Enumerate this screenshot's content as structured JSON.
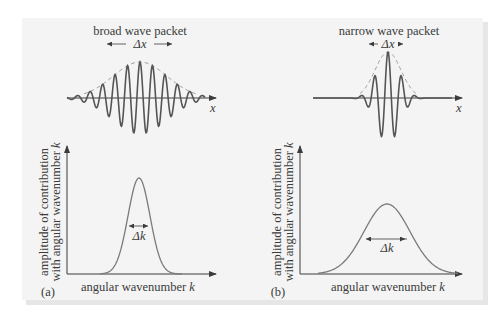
{
  "figure": {
    "panel_color": "#f4f4f4",
    "wave_color": "#555555",
    "envelope_color": "#9a9a9a",
    "axis_color": "#3c3c3c",
    "curve_color": "#7a7a7a"
  },
  "panel_a": {
    "tag": "(a)",
    "packet_title": "broad wave packet",
    "delta_x_label": "Δx",
    "x_axis_symbol": "x",
    "delta_k_label": "Δk",
    "xlabel_text": "angular wavenumber ",
    "xlabel_var": "k",
    "ylabel_line1": "amplitude of contribution",
    "ylabel_line2_text": "with angular wavenumber ",
    "ylabel_line2_var": "k"
  },
  "panel_b": {
    "tag": "(b)",
    "packet_title": "narrow wave packet",
    "delta_x_label": "Δx",
    "x_axis_symbol": "x",
    "delta_k_label": "Δk",
    "xlabel_text": "angular wavenumber ",
    "xlabel_var": "k",
    "ylabel_line1": "amplitude of contribution",
    "ylabel_line2_text": "with angular wavenumber ",
    "ylabel_line2_var": "k"
  },
  "chart_data": [
    {
      "type": "line",
      "title": "broad wave packet",
      "description": "Wave packet: many oscillations under a wide Gaussian envelope (dashed)",
      "xlabel": "x",
      "annotation": "Δx (wide)",
      "oscillations_visible": 9
    },
    {
      "type": "line",
      "title": "narrow wave packet",
      "description": "Wave packet: few oscillations under a narrow Gaussian envelope (dashed)",
      "xlabel": "x",
      "annotation": "Δx (narrow)",
      "oscillations_visible": 4
    },
    {
      "type": "line",
      "title": "(a)",
      "description": "Narrow, tall Gaussian amplitude spectrum",
      "xlabel": "angular wavenumber k",
      "ylabel": "amplitude of contribution with angular wavenumber k",
      "annotation": "Δk (narrow)",
      "relative_peak_height": 0.76,
      "relative_width": 0.2
    },
    {
      "type": "line",
      "title": "(b)",
      "description": "Broad, short Gaussian amplitude spectrum",
      "xlabel": "angular wavenumber k",
      "ylabel": "amplitude of contribution with angular wavenumber k",
      "annotation": "Δk (wide)",
      "relative_peak_height": 0.55,
      "relative_width": 0.5
    }
  ]
}
